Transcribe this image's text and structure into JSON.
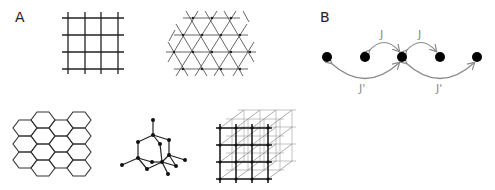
{
  "panels": {
    "a": {
      "label": "A",
      "lattices": [
        {
          "name": "square-lattice",
          "type": "square"
        },
        {
          "name": "triangular-lattice",
          "type": "triangular"
        },
        {
          "name": "honeycomb-lattice",
          "type": "honeycomb"
        },
        {
          "name": "diamond-lattice",
          "type": "diamond"
        },
        {
          "name": "cubic-lattice",
          "type": "simple-cubic"
        }
      ]
    },
    "b": {
      "label": "B",
      "chain": {
        "site_count": 5,
        "nearest_neighbor_label": "J",
        "next_nearest_neighbor_label": "J'"
      }
    }
  },
  "colors": {
    "lattice_line": "#333333",
    "node": "#000000",
    "arrow": "#8a8a8a",
    "label": "#222222"
  }
}
